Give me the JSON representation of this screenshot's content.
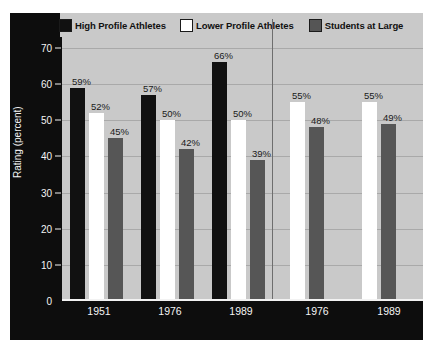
{
  "chart_data": {
    "type": "bar",
    "title": "",
    "xlabel": "",
    "ylabel": "Rating (percent)",
    "ylim": [
      0,
      73
    ],
    "yticks": [
      0,
      10,
      20,
      30,
      40,
      50,
      60,
      70
    ],
    "grid": true,
    "legend_position": "top",
    "panels": [
      {
        "name": "Men",
        "categories": [
          "1951",
          "1976",
          "1989"
        ],
        "series": [
          {
            "name": "High Profile Athletes",
            "values": [
              59,
              57,
              66
            ]
          },
          {
            "name": "Lower Profile Athletes",
            "values": [
              52,
              50,
              50
            ]
          },
          {
            "name": "Students at Large",
            "values": [
              45,
              42,
              39
            ]
          }
        ]
      },
      {
        "name": "Women",
        "categories": [
          "1976",
          "1989"
        ],
        "series": [
          {
            "name": "High Profile Athletes",
            "values": [
              null,
              null
            ]
          },
          {
            "name": "Lower Profile Athletes",
            "values": [
              55,
              55
            ]
          },
          {
            "name": "Students at Large",
            "values": [
              48,
              49
            ]
          }
        ]
      }
    ],
    "value_labels": [
      "59%",
      "52%",
      "45%",
      "57%",
      "50%",
      "42%",
      "66%",
      "50%",
      "39%",
      "55%",
      "48%",
      "55%",
      "49%"
    ],
    "colors": {
      "high_profile": "#111111",
      "lower_profile": "#ffffff",
      "students": "#565656",
      "panel_background": "#c9c9c9",
      "frame": "#0d0d0d",
      "gridline": "#a9a9a9",
      "axis_text": "#f4f4f4"
    }
  },
  "legend": {
    "items": [
      {
        "label": "High Profile Athletes",
        "swatch": "black-swatch"
      },
      {
        "label": "Lower Profile Athletes",
        "swatch": "white-swatch"
      },
      {
        "label": "Students at Large",
        "swatch": "gray-swatch"
      }
    ]
  },
  "axis": {
    "y_title": "Rating (percent)",
    "y_ticks": [
      "70",
      "60",
      "50",
      "40",
      "30",
      "20",
      "10",
      "0"
    ],
    "x_ticks_men": [
      "1951",
      "1976",
      "1989"
    ],
    "x_ticks_women": [
      "1976",
      "1989"
    ]
  },
  "groups": {
    "men": "Men",
    "women": "Women"
  },
  "bars": [
    {
      "panel": "Men",
      "category": "1951",
      "series": "High Profile Athletes",
      "value": 59,
      "label": "59%"
    },
    {
      "panel": "Men",
      "category": "1951",
      "series": "Lower Profile Athletes",
      "value": 52,
      "label": "52%"
    },
    {
      "panel": "Men",
      "category": "1951",
      "series": "Students at Large",
      "value": 45,
      "label": "45%"
    },
    {
      "panel": "Men",
      "category": "1976",
      "series": "High Profile Athletes",
      "value": 57,
      "label": "57%"
    },
    {
      "panel": "Men",
      "category": "1976",
      "series": "Lower Profile Athletes",
      "value": 50,
      "label": "50%"
    },
    {
      "panel": "Men",
      "category": "1976",
      "series": "Students at Large",
      "value": 42,
      "label": "42%"
    },
    {
      "panel": "Men",
      "category": "1989",
      "series": "High Profile Athletes",
      "value": 66,
      "label": "66%"
    },
    {
      "panel": "Men",
      "category": "1989",
      "series": "Lower Profile Athletes",
      "value": 50,
      "label": "50%"
    },
    {
      "panel": "Men",
      "category": "1989",
      "series": "Students at Large",
      "value": 39,
      "label": "39%"
    },
    {
      "panel": "Women",
      "category": "1976",
      "series": "Lower Profile Athletes",
      "value": 55,
      "label": "55%"
    },
    {
      "panel": "Women",
      "category": "1976",
      "series": "Students at Large",
      "value": 48,
      "label": "48%"
    },
    {
      "panel": "Women",
      "category": "1989",
      "series": "Lower Profile Athletes",
      "value": 55,
      "label": "55%"
    },
    {
      "panel": "Women",
      "category": "1989",
      "series": "Students at Large",
      "value": 49,
      "label": "49%"
    }
  ]
}
